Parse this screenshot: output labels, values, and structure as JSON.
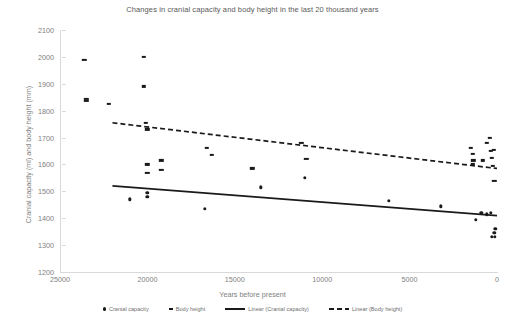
{
  "chart_data": {
    "type": "scatter",
    "title": "Changes in cranial capacity and body height in the last 20 thousand years",
    "xlabel": "Years before present",
    "ylabel": "Cranial capacity (ml) and body height (mm)",
    "xlim": [
      25000,
      0
    ],
    "ylim": [
      1200,
      2100
    ],
    "x_reversed": true,
    "xticks": [
      25000,
      20000,
      15000,
      10000,
      5000,
      0
    ],
    "xtick_labels": [
      "25000",
      "20000",
      "15000",
      "10000",
      "5000",
      "0"
    ],
    "yticks": [
      1200,
      1300,
      1400,
      1500,
      1600,
      1700,
      1800,
      1900,
      2000,
      2100
    ],
    "ytick_labels": [
      "1200",
      "1300",
      "1400",
      "1500",
      "1600",
      "1700",
      "1800",
      "1900",
      "2000",
      "2100"
    ],
    "grid": false,
    "legend_position": "bottom",
    "series": [
      {
        "name": "Cranial capacity",
        "marker": "circle",
        "color": "#1a1a1a",
        "points": [
          [
            21000,
            1470
          ],
          [
            20000,
            1495
          ],
          [
            20000,
            1480
          ],
          [
            16700,
            1435
          ],
          [
            13500,
            1515
          ],
          [
            11000,
            1550
          ],
          [
            6200,
            1465
          ],
          [
            3200,
            1445
          ],
          [
            1200,
            1395
          ],
          [
            900,
            1420
          ],
          [
            600,
            1415
          ],
          [
            350,
            1420
          ],
          [
            300,
            1330
          ],
          [
            150,
            1345
          ],
          [
            120,
            1330
          ],
          [
            100,
            1360
          ]
        ]
      },
      {
        "name": "Body height",
        "marker": "dash",
        "color": "#1a1a1a",
        "points": [
          [
            22200,
            1825
          ],
          [
            20200,
            2000
          ],
          [
            20200,
            1890
          ],
          [
            20100,
            1755
          ],
          [
            20000,
            1730
          ],
          [
            20000,
            1600
          ],
          [
            20000,
            1570
          ],
          [
            19200,
            1615
          ],
          [
            19200,
            1580
          ],
          [
            23600,
            1990
          ],
          [
            23500,
            1845
          ],
          [
            23500,
            1835
          ],
          [
            16600,
            1660
          ],
          [
            16300,
            1635
          ],
          [
            14000,
            1585
          ],
          [
            11200,
            1680
          ],
          [
            10900,
            1620
          ],
          [
            1500,
            1660
          ],
          [
            1400,
            1640
          ],
          [
            1400,
            1600
          ],
          [
            1350,
            1615
          ],
          [
            800,
            1615
          ],
          [
            600,
            1680
          ],
          [
            400,
            1700
          ],
          [
            350,
            1650
          ],
          [
            300,
            1625
          ],
          [
            250,
            1595
          ],
          [
            200,
            1655
          ],
          [
            150,
            1540
          ]
        ]
      }
    ],
    "trendlines": [
      {
        "name": "Linear (Cranial capacity)",
        "style": "solid",
        "color": "#1a1a1a",
        "x0": 22000,
        "y0": 1520,
        "x1": 0,
        "y1": 1410
      },
      {
        "name": "Linear (Body height)",
        "style": "dashed",
        "color": "#1a1a1a",
        "x0": 22000,
        "y0": 1755,
        "x1": 0,
        "y1": 1585
      }
    ]
  },
  "legend": {
    "items": [
      {
        "label": "Cranial capacity",
        "marker": "circle"
      },
      {
        "label": "Body height",
        "marker": "dash"
      },
      {
        "label": "Linear (Cranial capacity)",
        "marker": "solid-line"
      },
      {
        "label": "Linear (Body height)",
        "marker": "dashed-line"
      }
    ]
  }
}
